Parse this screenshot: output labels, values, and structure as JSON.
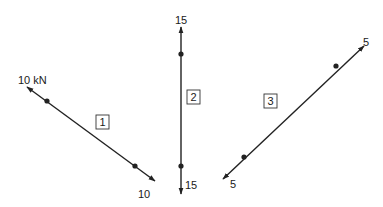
{
  "diagram": {
    "type": "truss member free-body forces",
    "line_color": "#222222",
    "members": [
      {
        "id": "1",
        "box_label": "1",
        "orientation": "diagonal descending left-to-right",
        "force_label_start": "10 kN",
        "force_label_end": "10",
        "line": {
          "x1": 27,
          "y1": 87,
          "x2": 155,
          "y2": 181
        },
        "nodes": [
          {
            "x": 47,
            "y": 101
          },
          {
            "x": 135,
            "y": 166
          }
        ],
        "box": {
          "x": 97,
          "y": 117
        }
      },
      {
        "id": "2",
        "box_label": "2",
        "orientation": "vertical",
        "force_label_start": "15",
        "force_label_end": "15",
        "line": {
          "x1": 181,
          "y1": 28,
          "x2": 181,
          "y2": 193
        },
        "nodes": [
          {
            "x": 181,
            "y": 54
          },
          {
            "x": 181,
            "y": 165
          }
        ],
        "box": {
          "x": 188,
          "y": 91
        }
      },
      {
        "id": "3",
        "box_label": "3",
        "orientation": "diagonal ascending left-to-right",
        "force_label_start": "5",
        "force_label_end": "5",
        "line": {
          "x1": 364,
          "y1": 46,
          "x2": 223,
          "y2": 178
        },
        "nodes": [
          {
            "x": 336,
            "y": 66
          },
          {
            "x": 244,
            "y": 157
          }
        ],
        "box": {
          "x": 264,
          "y": 94
        }
      }
    ]
  }
}
